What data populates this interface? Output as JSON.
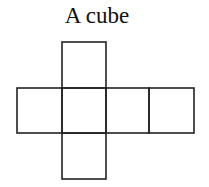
{
  "title": "A cube",
  "net": {
    "stroke": "#222222",
    "faces": [
      {
        "name": "top",
        "x": 62,
        "y": 42,
        "w": 44,
        "h": 46
      },
      {
        "name": "left",
        "x": 17,
        "y": 88,
        "w": 45,
        "h": 45
      },
      {
        "name": "center",
        "x": 62,
        "y": 88,
        "w": 44,
        "h": 45
      },
      {
        "name": "right",
        "x": 106,
        "y": 88,
        "w": 43,
        "h": 45
      },
      {
        "name": "far-right",
        "x": 149,
        "y": 88,
        "w": 45,
        "h": 45
      },
      {
        "name": "bottom",
        "x": 62,
        "y": 133,
        "w": 44,
        "h": 46
      }
    ]
  }
}
